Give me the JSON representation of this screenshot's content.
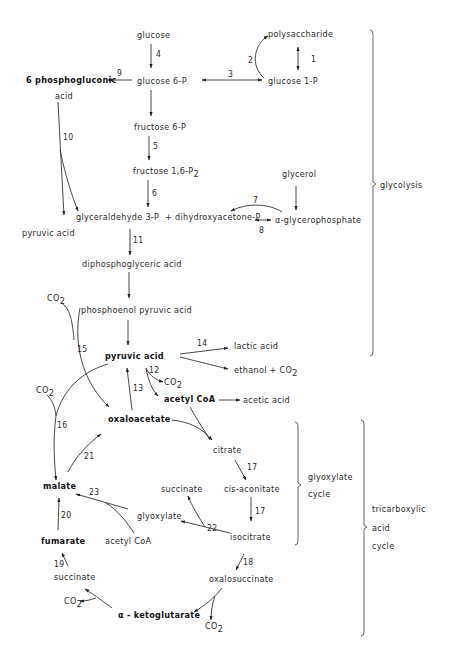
{
  "metabolites": {
    "glucose": "glucose",
    "polysaccharide": "polysaccharide",
    "glucose_6p": "glucose  6-P",
    "glucose_1p": "glucose  1-P",
    "phosphogluconic": "6 phosphogluconic",
    "phosphogluconic_acid": "acid",
    "fructose_6p": "fructose  6-P",
    "fructose_16p2": "fructose  1,6-P",
    "fructose_16p2_sub": "2",
    "glycerol": "glycerol",
    "glyceraldehyde_3p": "glyceraldehyde 3-P",
    "dihydroxyacetone_p": "+ dihydroxyacetone-P",
    "alpha_glycerophosphate": "α-glycerophosphate",
    "pyruvic_acid_left": "pyruvic  acid",
    "diphosphoglyceric_acid": "diphosphoglyceric  acid",
    "phosphoenol_pyruvic_acid": "phosphoenol  pyruvic  acid",
    "pyruvic_acid": "pyruvic  acid",
    "lactic_acid": "lactic  acid",
    "ethanol_co2": "ethanol  + CO",
    "acetyl_coa": "acetyl  CoA",
    "acetic_acid": "acetic  acid",
    "oxaloacetate": "oxaloacetate",
    "citrate": "citrate",
    "cis_aconitate": "cis-aconitate",
    "isocitrate": "isocitrate",
    "succinate_glyox": "succinate",
    "glyoxylate": "glyoxylate",
    "acetyl_coa_glyox": "acetyl  CoA",
    "malate": "malate",
    "fumarate": "fumarate",
    "succinate": "succinate",
    "oxalosuccinate": "oxalosuccinate",
    "alpha_ketoglutarate": "α - ketoglutarate",
    "co2": "CO",
    "co2_sub": "2"
  },
  "reaction_numbers": [
    "1",
    "2",
    "3",
    "4",
    "5",
    "6",
    "7",
    "8",
    "9",
    "10",
    "11",
    "12",
    "13",
    "14",
    "15",
    "16",
    "17",
    "17",
    "18",
    "19",
    "20",
    "21",
    "22",
    "23"
  ],
  "pathways": {
    "glycolysis": "glycolysis",
    "glyoxylate_cycle": [
      "glyoxylate",
      "cycle"
    ],
    "tca_cycle": [
      "tricarboxylic",
      "acid",
      "cycle"
    ]
  }
}
